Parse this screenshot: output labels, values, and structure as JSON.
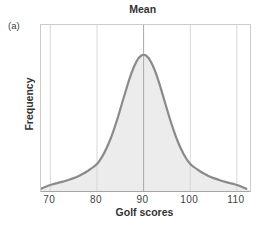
{
  "panel_label": "(a)",
  "chart_data": {
    "type": "area",
    "title": "Mean",
    "xlabel": "Golf scores",
    "ylabel": "Frequency",
    "x_ticks": [
      70,
      80,
      90,
      100,
      110
    ],
    "x_range": [
      68,
      112.8
    ],
    "y_range": [
      0,
      1
    ],
    "mean": 90,
    "legend": "none",
    "grid": "vertical gridline at each x tick; darker vertical line at mean (90) spanning plot height",
    "curve": {
      "x": [
        68,
        69,
        70,
        71,
        72,
        73,
        74,
        75,
        76,
        77,
        78,
        79,
        80,
        81,
        82,
        83,
        84,
        85,
        86,
        87,
        88,
        89,
        90,
        91,
        92,
        93,
        94,
        95,
        96,
        97,
        98,
        99,
        100,
        101,
        102,
        103,
        104,
        105,
        106,
        107,
        108,
        109,
        110,
        111,
        112
      ],
      "y": [
        0.016,
        0.032,
        0.045,
        0.054,
        0.062,
        0.071,
        0.082,
        0.094,
        0.108,
        0.125,
        0.145,
        0.17,
        0.194,
        0.243,
        0.306,
        0.387,
        0.485,
        0.596,
        0.713,
        0.824,
        0.917,
        0.978,
        1.0,
        0.978,
        0.917,
        0.824,
        0.713,
        0.596,
        0.485,
        0.387,
        0.306,
        0.243,
        0.194,
        0.17,
        0.145,
        0.125,
        0.108,
        0.094,
        0.082,
        0.071,
        0.062,
        0.054,
        0.045,
        0.032,
        0.016
      ]
    },
    "colors": {
      "curve_stroke": "#8a8a8a",
      "curve_fill": "#ececec",
      "gridline": "#d7d7d7",
      "mean_line": "#a8a8a8",
      "box_border": "#cbcbcb",
      "axis_line": "#a6a6a6",
      "text": "#333333"
    }
  }
}
